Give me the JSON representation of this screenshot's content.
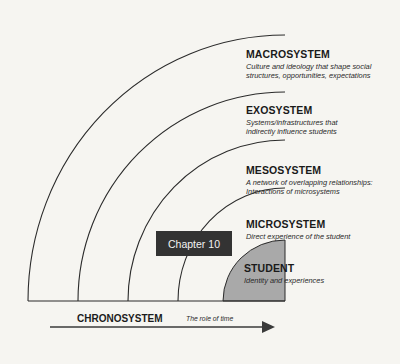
{
  "diagram": {
    "type": "nested-ecological-systems",
    "layers": [
      {
        "id": "macrosystem",
        "title": "MACROSYSTEM",
        "description": "Culture and ideology that shape social structures, opportunities, expectations"
      },
      {
        "id": "exosystem",
        "title": "EXOSYSTEM",
        "description": "Systems/infrastructures that indirectly influence students"
      },
      {
        "id": "mesosystem",
        "title": "MESOSYSTEM",
        "description": "A network of overlapping relationships: Interactions of microsystems"
      },
      {
        "id": "microsystem",
        "title": "MICROSYSTEM",
        "description": "Direct experience of the student"
      },
      {
        "id": "student",
        "title": "STUDENT",
        "description": "Identity and experiences"
      }
    ],
    "chapter_tag": "Chapter 10",
    "chronosystem": {
      "title": "CHRONOSYSTEM",
      "description": "The role of time"
    },
    "colors": {
      "line": "#2b2b2b",
      "student_fill": "#a9a9a9",
      "chapter_box": "#333333",
      "background": "#f6f5f1"
    }
  }
}
